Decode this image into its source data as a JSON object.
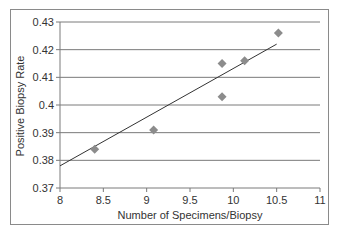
{
  "chart_data": {
    "type": "scatter",
    "title": "",
    "xlabel": "Number of Specimens/Biopsy",
    "ylabel": "Positive Biopsy Rate",
    "xlim": [
      8,
      11
    ],
    "ylim": [
      0.37,
      0.43
    ],
    "x_ticks": [
      "8",
      "8.5",
      "9",
      "9.5",
      "10",
      "10.5",
      "11"
    ],
    "y_ticks": [
      "0.43",
      "0.42",
      "0.41",
      "0.4",
      "0.39",
      "0.38",
      "0.37"
    ],
    "grid": "horizontal",
    "legend": "none",
    "series": [
      {
        "name": "Observed",
        "marker": "diamond",
        "color": "#8c8c8c",
        "points": [
          {
            "x": 8.4,
            "y": 0.384
          },
          {
            "x": 9.08,
            "y": 0.391
          },
          {
            "x": 9.87,
            "y": 0.403
          },
          {
            "x": 9.87,
            "y": 0.415
          },
          {
            "x": 10.13,
            "y": 0.416
          },
          {
            "x": 10.52,
            "y": 0.426
          }
        ]
      },
      {
        "name": "Linear trend",
        "type": "line",
        "color": "#333333",
        "points": [
          {
            "x": 8.0,
            "y": 0.378
          },
          {
            "x": 10.5,
            "y": 0.422
          }
        ]
      }
    ]
  }
}
